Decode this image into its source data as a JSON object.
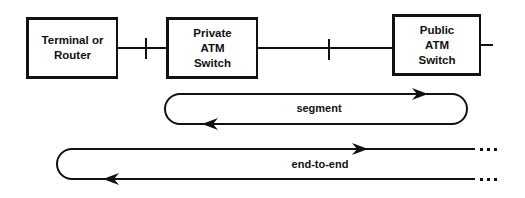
{
  "diagram": {
    "type": "network-connection-scope",
    "nodes": [
      {
        "id": "terminal",
        "lines": [
          "Terminal or",
          "Router"
        ]
      },
      {
        "id": "private-switch",
        "lines": [
          "Private",
          "ATM",
          "Switch"
        ]
      },
      {
        "id": "public-switch",
        "lines": [
          "Public",
          "ATM",
          "Switch"
        ]
      }
    ],
    "links": [
      {
        "from": "terminal",
        "to": "private-switch",
        "marker": "tick"
      },
      {
        "from": "private-switch",
        "to": "public-switch",
        "marker": "tick"
      },
      {
        "from": "public-switch",
        "to": "continues-right",
        "marker": "none"
      }
    ],
    "loops": [
      {
        "id": "segment",
        "label": "segment",
        "span": "private-switch to public-switch",
        "open_right": false
      },
      {
        "id": "end-to-end",
        "label": "end-to-end",
        "span": "terminal onward",
        "open_right": true
      }
    ],
    "colors": {
      "stroke": "#111111",
      "background": "#ffffff"
    }
  }
}
